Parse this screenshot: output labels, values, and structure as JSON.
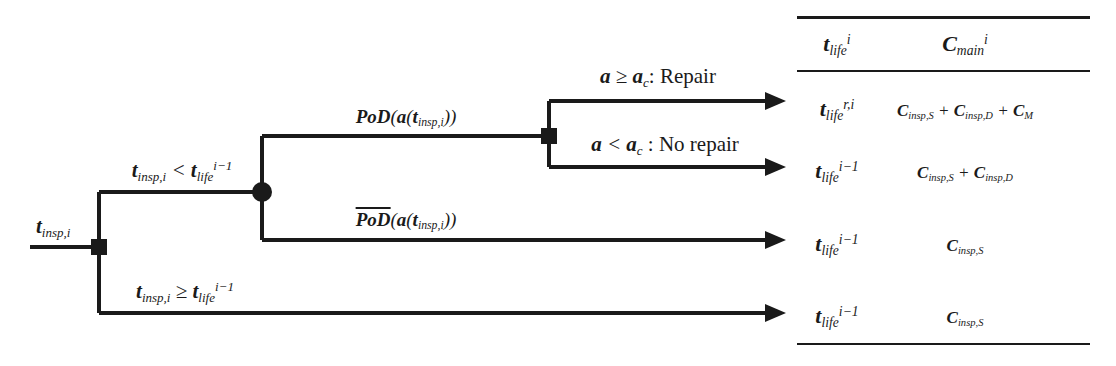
{
  "diagram": {
    "type": "decision-tree",
    "title_present": false,
    "root_label": "t_insp,i",
    "nodes": [
      {
        "id": "root-decision",
        "shape": "square",
        "x": 99,
        "y": 247
      },
      {
        "id": "chance-node",
        "shape": "circle",
        "x": 262,
        "y": 192
      },
      {
        "id": "second-decision",
        "shape": "square",
        "x": 549,
        "y": 136
      }
    ],
    "branch_labels": {
      "upper_condition": "t_insp,i < t_life^(i-1)",
      "lower_condition": "t_insp,i >= t_life^(i-1)",
      "detect": "PoD(a(t_insp,i))",
      "no_detect": "not PoD(a(t_insp,i))",
      "repair": "a >= a_c : Repair",
      "no_repair": "a < a_c : No repair"
    },
    "outcome_arrows": 4
  },
  "text": {
    "t": "t",
    "C": "C",
    "insp_i": "insp,i",
    "life": "life",
    "main": "main",
    "i": "i",
    "i_minus_1": "i−1",
    "r_i": "r,i",
    "a": "a",
    "a_c_sub": "c",
    "PoD": "PoD",
    "alpha": "a",
    "ge": "≥",
    "lt": "<",
    "plus": "+",
    "colon": ":",
    "repair_word": "Repair",
    "no_repair_word": "No repair",
    "insp_S": "insp,S",
    "insp_D": "insp,D",
    "M": "M",
    "lparen": "(",
    "rparen": ")"
  },
  "table": {
    "headers": {
      "col1": "t_life^i",
      "col2": "C_main^i"
    },
    "rows": [
      {
        "col1": "t_life^{r,i}",
        "col2": "C_insp,S + C_insp,D + C_M"
      },
      {
        "col1": "t_life^{i-1}",
        "col2": "C_insp,S + C_insp,D"
      },
      {
        "col1": "t_life^{i-1}",
        "col2": "C_insp,S"
      },
      {
        "col1": "t_life^{i-1}",
        "col2": "C_insp,S"
      }
    ]
  },
  "colors": {
    "ink": "#1a1a1a",
    "background": "#ffffff"
  }
}
